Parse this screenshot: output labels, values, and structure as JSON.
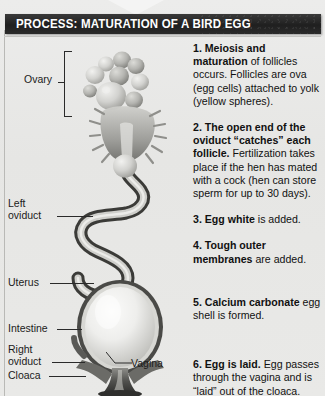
{
  "header": {
    "title": "PROCESS: MATURATION OF A BIRD EGG",
    "bar_color": "#262626",
    "text_color": "#ffffff"
  },
  "page": {
    "background_color": "#e8e8e6"
  },
  "labels": {
    "ovary": "Ovary",
    "left_oviduct": "Left\noviduct",
    "uterus": "Uterus",
    "intestine": "Intestine",
    "right_oviduct": "Right\noviduct",
    "cloaca": "Cloaca",
    "vagina": "Vagina"
  },
  "steps": [
    {
      "number": "1.",
      "lead": "Meiosis and maturation",
      "rest": " of follicles occurs. Follicles are ova (egg cells) attached to yolk (yellow spheres)."
    },
    {
      "number": "2.",
      "lead": "The open end of the oviduct “catches” each follicle.",
      "rest": " Fertilization takes place if the hen has mated with a cock (hen can store sperm for up to 30 days)."
    },
    {
      "number": "3.",
      "lead": "Egg white",
      "rest": " is added."
    },
    {
      "number": "4.",
      "lead": "Tough outer membranes",
      "rest": " are added."
    },
    {
      "number": "5.",
      "lead": "Calcium carbonate",
      "rest": " egg shell is formed."
    },
    {
      "number": "6.",
      "lead": "Egg is laid.",
      "rest": " Egg passes through the vagina and is “laid” out of the cloaca."
    }
  ]
}
